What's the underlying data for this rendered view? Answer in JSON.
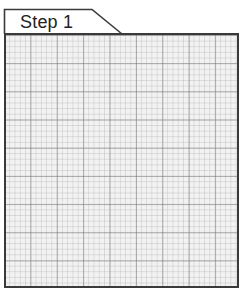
{
  "tab": {
    "label": "Step 1"
  },
  "grid": {
    "type": "graph-paper",
    "major_columns": 9,
    "major_rows": 9,
    "minor_subdivisions": 5,
    "border_color": "#3a3a3a",
    "major_line_color": "#8a8a8a",
    "minor_line_color": "#cfcfcf",
    "background_color": "#f2f2f2"
  }
}
